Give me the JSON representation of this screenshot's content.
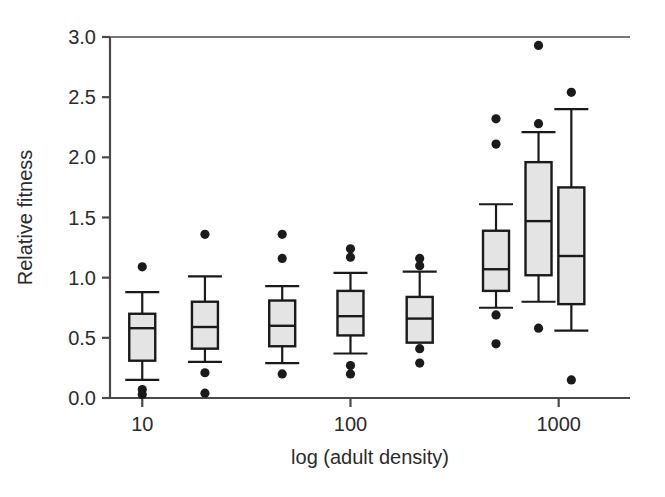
{
  "chart_data": {
    "type": "box",
    "title": "",
    "xlabel": "log (adult density)",
    "ylabel": "Relative fitness",
    "ylim": [
      0.0,
      3.0
    ],
    "yticks": [
      0.0,
      0.5,
      1.0,
      1.5,
      2.0,
      2.5,
      3.0
    ],
    "ytick_labels": [
      "0.0",
      "0.5",
      "1.0",
      "1.5",
      "2.0",
      "2.5",
      "3.0"
    ],
    "xticks": [
      10,
      100,
      1000
    ],
    "xtick_labels": [
      "10",
      "100",
      "1000"
    ],
    "x_scale": "log",
    "xlim": [
      7,
      2200
    ],
    "grid": false,
    "legend": null,
    "box_fill": "#e4e4e4",
    "box_edge": "#1a1a1a",
    "outlier_color": "#1a1a1a",
    "axis_color": "#4a4a4a",
    "boxes": [
      {
        "name": "box-1",
        "x": 10,
        "whisker_low": 0.15,
        "q1": 0.31,
        "median": 0.58,
        "q3": 0.7,
        "whisker_high": 0.88,
        "outliers": [
          1.09,
          0.07,
          0.03
        ]
      },
      {
        "name": "box-2",
        "x": 20,
        "whisker_low": 0.3,
        "q1": 0.41,
        "median": 0.59,
        "q3": 0.8,
        "whisker_high": 1.01,
        "outliers": [
          1.36,
          0.21,
          0.04
        ]
      },
      {
        "name": "box-3",
        "x": 47,
        "whisker_low": 0.29,
        "q1": 0.43,
        "median": 0.6,
        "q3": 0.81,
        "whisker_high": 0.93,
        "outliers": [
          1.36,
          1.16,
          0.2
        ]
      },
      {
        "name": "box-4",
        "x": 100,
        "whisker_low": 0.37,
        "q1": 0.52,
        "median": 0.68,
        "q3": 0.89,
        "whisker_high": 1.04,
        "outliers": [
          1.24,
          1.17,
          0.27,
          0.2
        ]
      },
      {
        "name": "box-5",
        "x": 215,
        "whisker_low": 0.46,
        "q1": 0.46,
        "median": 0.66,
        "q3": 0.84,
        "whisker_high": 1.05,
        "outliers": [
          1.16,
          1.1,
          0.41,
          0.29
        ]
      },
      {
        "name": "box-6",
        "x": 500,
        "whisker_low": 0.75,
        "q1": 0.89,
        "median": 1.07,
        "q3": 1.39,
        "whisker_high": 1.61,
        "outliers": [
          2.32,
          2.11,
          0.69,
          0.45
        ]
      },
      {
        "name": "box-7",
        "x": 800,
        "whisker_low": 0.8,
        "q1": 1.02,
        "median": 1.47,
        "q3": 1.96,
        "whisker_high": 2.21,
        "outliers": [
          2.93,
          2.28,
          0.58
        ]
      },
      {
        "name": "box-8",
        "x": 1150,
        "whisker_low": 0.56,
        "q1": 0.78,
        "median": 1.18,
        "q3": 1.75,
        "whisker_high": 2.4,
        "outliers": [
          2.54,
          0.15
        ]
      }
    ]
  }
}
